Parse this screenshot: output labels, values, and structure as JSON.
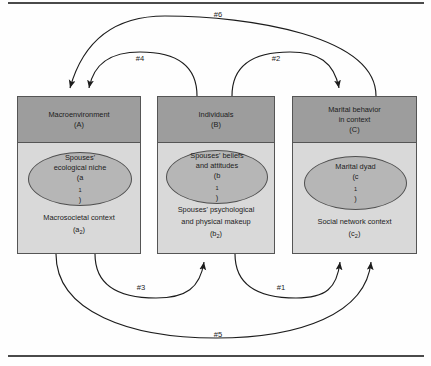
{
  "figure": {
    "type": "conceptual-diagram",
    "rules": {
      "top": "horizontal-rule",
      "bottom": "horizontal-rule"
    }
  },
  "boxes": [
    {
      "id": "A",
      "header_line1": "Macroenvironment",
      "header_line2": "(A)",
      "oval_line1": "Spouses'",
      "oval_line2": "ecological niche",
      "oval_line3": "(a",
      "oval_sub": "1",
      "oval_line3_end": ")",
      "body_line1": "Macrosocietal context",
      "body_line2": "(a",
      "body_sub": "2",
      "body_line2_end": ")"
    },
    {
      "id": "B",
      "header_line1": "Individuals",
      "header_line2": "(B)",
      "oval_line1": "Spouses' beliefs",
      "oval_line2": "and attitudes",
      "oval_line3": "(b",
      "oval_sub": "1",
      "oval_line3_end": ")",
      "body_line1": "Spouses' psychological",
      "body_line1b": "and physical makeup",
      "body_line2": "(b",
      "body_sub": "2",
      "body_line2_end": ")"
    },
    {
      "id": "C",
      "header_line1": "Marital behavior",
      "header_line1b": "in context",
      "header_line2": "(C)",
      "oval_line1": "Marital dyad",
      "oval_line3": "(c",
      "oval_sub": "1",
      "oval_line3_end": ")",
      "body_line1": "Social network context",
      "body_line2": "(c",
      "body_sub": "2",
      "body_line2_end": ")"
    }
  ],
  "arrows": [
    {
      "label": "#6",
      "from": "C",
      "to": "A",
      "position": "top-outer"
    },
    {
      "label": "#4",
      "from": "B",
      "to": "A",
      "position": "top-inner-left"
    },
    {
      "label": "#2",
      "from": "B",
      "to": "C",
      "position": "top-inner-right"
    },
    {
      "label": "#3",
      "from": "A",
      "to": "B",
      "position": "bottom-inner-left"
    },
    {
      "label": "#1",
      "from": "B",
      "to": "C",
      "position": "bottom-inner-right"
    },
    {
      "label": "#5",
      "from": "A",
      "to": "C",
      "position": "bottom-outer"
    }
  ],
  "colors": {
    "header_fill": "#9d9d9d",
    "body_fill": "#d9d9d9",
    "oval_fill": "#b6b6b6",
    "stroke": "#555555",
    "rule": "#4a4a4a"
  }
}
